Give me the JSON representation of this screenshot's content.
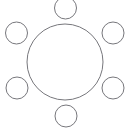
{
  "canvas": {
    "width": 130,
    "height": 135,
    "background": "#ffffff",
    "title": "Radial circle diagram"
  },
  "style": {
    "stroke_color": "#77777c",
    "stroke_width": 1,
    "fill": "none"
  },
  "chart_data": {
    "type": "diagram",
    "title": "",
    "center": {
      "name": "center-circle",
      "cx": 65,
      "cy": 62,
      "r": 38,
      "label": ""
    },
    "satellites": [
      {
        "name": "satellite-top",
        "angle_deg": 90,
        "cx": 65.5,
        "cy": 8,
        "r": 11,
        "label": ""
      },
      {
        "name": "satellite-upper-right",
        "angle_deg": 30,
        "cx": 113,
        "cy": 33,
        "r": 11,
        "label": ""
      },
      {
        "name": "satellite-lower-right",
        "angle_deg": 330,
        "cx": 113,
        "cy": 88,
        "r": 11,
        "label": ""
      },
      {
        "name": "satellite-bottom",
        "angle_deg": 270,
        "cx": 66,
        "cy": 116,
        "r": 11,
        "label": ""
      },
      {
        "name": "satellite-lower-left",
        "angle_deg": 210,
        "cx": 17,
        "cy": 88,
        "r": 11,
        "label": ""
      },
      {
        "name": "satellite-upper-left",
        "angle_deg": 150,
        "cx": 16.5,
        "cy": 33,
        "r": 11,
        "label": ""
      }
    ],
    "counts": {
      "total_circles": 7,
      "satellite_count": 6
    }
  }
}
